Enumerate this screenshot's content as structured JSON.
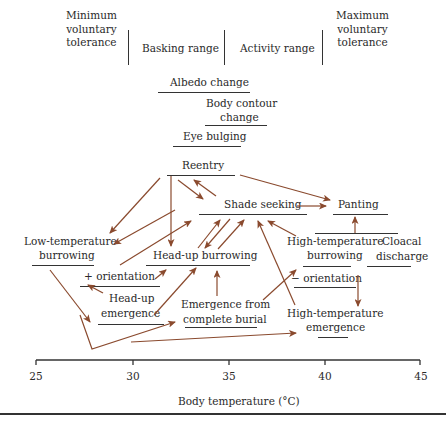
{
  "header_ranges": [
    {
      "label": "Minimum\nvoluntary\ntolerance"
    },
    {
      "label": "Basking range"
    },
    {
      "label": "Activity range"
    },
    {
      "label": "Maximum\nvoluntary\ntolerance"
    }
  ],
  "behaviors": {
    "albedo_change": "Albedo change",
    "body_contour_change_1": "Body contour",
    "body_contour_change_2": "change",
    "eye_bulging": "Eye bulging",
    "reentry": "Reentry",
    "shade_seeking": "Shade seeking",
    "panting": "Panting",
    "low_temp_burrowing_1": "Low-temperature",
    "low_temp_burrowing_2": "burrowing",
    "head_up_burrowing": "Head-up burrowing",
    "plus_orientation": "+ orientation",
    "head_up_emergence_1": "Head-up",
    "head_up_emergence_2": "emergence",
    "emergence_complete_burial_1": "Emergence from",
    "emergence_complete_burial_2": "complete burial",
    "high_temp_burrowing_1": "High-temperature",
    "high_temp_burrowing_2": "burrowing",
    "cloacal_discharge_1": "Cloacal",
    "cloacal_discharge_2": "discharge",
    "minus_orientation": "− orientation",
    "high_temp_emergence_1": "High-temperature",
    "high_temp_emergence_2": "emergence"
  },
  "axis": {
    "ticks": [
      "25",
      "30",
      "35",
      "40",
      "45"
    ],
    "xlabel": "Body temperature (°C)",
    "range": [
      25,
      45
    ]
  },
  "colors": {
    "arrow": "#8a4a2e",
    "text": "#2a2a2a",
    "rule": "#333333"
  }
}
